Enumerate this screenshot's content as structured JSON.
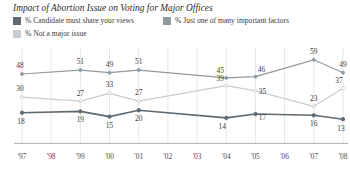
{
  "title": "Impact of Abortion Issue on Voting for Major Offices",
  "legend": [
    {
      "label": "% Candidate must share your views",
      "color": "#5f6a72"
    },
    {
      "label": "% Just one of many important factors",
      "color": "#8f9aa2"
    },
    {
      "label": "% Not a major issue",
      "color": "#c8cdd1"
    }
  ],
  "chart_data": {
    "type": "line",
    "title": "Impact of Abortion Issue on Voting for Major Offices",
    "xlabel": "",
    "ylabel": "",
    "ylim": [
      0,
      65
    ],
    "grid": "vertical",
    "legend_position": "top",
    "categories": [
      "'97",
      "'98",
      "'99",
      "'00",
      "'01",
      "'02",
      "'03",
      "'04",
      "'05",
      "'06",
      "'07",
      "'08"
    ],
    "series": [
      {
        "name": "% Just one of many important factors",
        "color": "#8f9aa2",
        "points": [
          {
            "x": "'97",
            "value": 48,
            "label": "48"
          },
          {
            "x": "'99",
            "value": 51,
            "label": "51"
          },
          {
            "x": "'00",
            "value": 49,
            "label": "49"
          },
          {
            "x": "'01",
            "value": 51,
            "label": "51"
          },
          {
            "x": "'04",
            "value": 45,
            "label": "45"
          },
          {
            "x": "'05",
            "value": 46,
            "label": "46"
          },
          {
            "x": "'07",
            "value": 59,
            "label": "59"
          },
          {
            "x": "'08",
            "value": 49,
            "label": "49"
          }
        ]
      },
      {
        "name": "% Not a major issue",
        "color": "#c8cdd1",
        "points": [
          {
            "x": "'97",
            "value": 30,
            "label": "30"
          },
          {
            "x": "'99",
            "value": 27,
            "label": "27"
          },
          {
            "x": "'00",
            "value": 33,
            "label": "33"
          },
          {
            "x": "'01",
            "value": 27,
            "label": "27"
          },
          {
            "x": "'04",
            "value": 39,
            "label": "39"
          },
          {
            "x": "'05",
            "value": 35,
            "label": "35"
          },
          {
            "x": "'07",
            "value": 23,
            "label": "23"
          },
          {
            "x": "'08",
            "value": 37,
            "label": "37"
          }
        ]
      },
      {
        "name": "% Candidate must share your views",
        "color": "#5f6a72",
        "points": [
          {
            "x": "'97",
            "value": 18,
            "label": "18"
          },
          {
            "x": "'99",
            "value": 19,
            "label": "19"
          },
          {
            "x": "'00",
            "value": 15,
            "label": "15"
          },
          {
            "x": "'01",
            "value": 20,
            "label": "20"
          },
          {
            "x": "'04",
            "value": 14,
            "label": "14"
          },
          {
            "x": "'05",
            "value": 17,
            "label": "17"
          },
          {
            "x": "'07",
            "value": 16,
            "label": "16"
          },
          {
            "x": "'08",
            "value": 13,
            "label": "13"
          }
        ]
      }
    ]
  }
}
